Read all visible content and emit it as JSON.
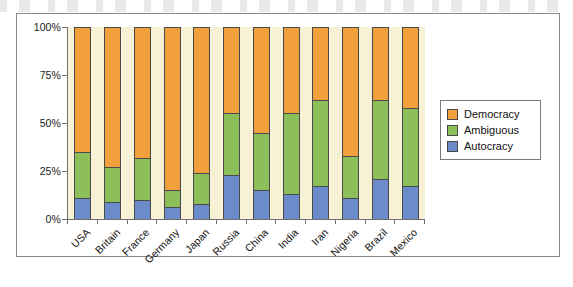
{
  "chart_data": {
    "type": "bar",
    "stacked": true,
    "stacked_mode": "percent",
    "title": "",
    "xlabel": "",
    "ylabel": "",
    "ylim": [
      0,
      100
    ],
    "ytick_labels": [
      "0%",
      "25%",
      "50%",
      "75%",
      "100%"
    ],
    "ytick_values": [
      0,
      25,
      50,
      75,
      100
    ],
    "grid": false,
    "legend_position": "right",
    "categories": [
      "USA",
      "Britain",
      "France",
      "Germany",
      "Japan",
      "Russia",
      "China",
      "India",
      "Iran",
      "Nigeria",
      "Brazil",
      "Mexico"
    ],
    "series": [
      {
        "name": "Autocracy",
        "color": "#6B8CC8",
        "values": [
          11,
          9,
          10,
          6,
          8,
          23,
          15,
          13,
          17,
          11,
          21,
          17
        ]
      },
      {
        "name": "Ambiguous",
        "color": "#8CBF5A",
        "values": [
          24,
          18,
          22,
          9,
          16,
          32,
          30,
          42,
          45,
          22,
          41,
          41
        ]
      },
      {
        "name": "Democracy",
        "color": "#F2A03C",
        "values": [
          65,
          73,
          68,
          85,
          76,
          45,
          55,
          45,
          38,
          67,
          38,
          42
        ]
      }
    ]
  },
  "legend": {
    "items": [
      {
        "label": "Democracy",
        "color": "#F2A03C"
      },
      {
        "label": "Ambiguous",
        "color": "#8CBF5A"
      },
      {
        "label": "Autocracy",
        "color": "#6B8CC8"
      }
    ]
  },
  "plot": {
    "background_color": "#F7F2D5",
    "axis_color": "#6F6F6F",
    "frame_color": "#8A8A8A"
  }
}
